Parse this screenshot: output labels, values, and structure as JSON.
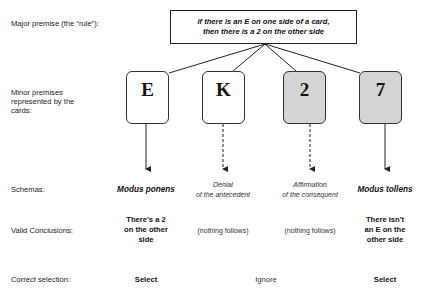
{
  "row_labels": {
    "major": "Major premise (the “rule”):",
    "minor_1": "Minor premises",
    "minor_2": "represented by the",
    "minor_3": "cards:",
    "schemas": "Schemas:",
    "conclusions": "Valid Conclusions:",
    "selection": "Correct selection:"
  },
  "rule": {
    "line1": "if there is an E on one side of a card,",
    "line2": "then there is a 2 on the other side"
  },
  "cards": [
    {
      "face": "E",
      "fill": "#ffffff",
      "arrow": "solid",
      "schema": [
        "Modus ponens"
      ],
      "schema_style": "bold-italic",
      "conclusion": [
        "There's a 2",
        "on the other",
        "side"
      ],
      "conclusion_style": "bold"
    },
    {
      "face": "K",
      "fill": "#ffffff",
      "arrow": "dashed",
      "schema": [
        "Denial",
        "of the antecedent"
      ],
      "schema_style": "italic",
      "conclusion": [
        "(nothing follows)"
      ],
      "conclusion_style": "plain"
    },
    {
      "face": "2",
      "fill": "#d4d4d4",
      "arrow": "dashed",
      "schema": [
        "Affirmation",
        "of the consequent"
      ],
      "schema_style": "italic",
      "conclusion": [
        "(nothing follows)"
      ],
      "conclusion_style": "plain"
    },
    {
      "face": "7",
      "fill": "#d4d4d4",
      "arrow": "solid",
      "schema": [
        "Modus tollens"
      ],
      "schema_style": "bold-italic",
      "conclusion": [
        "There isn't",
        "an E on the",
        "other side"
      ],
      "conclusion_style": "bold"
    }
  ],
  "selection": {
    "left": "Select",
    "middle": "Ignore",
    "right": "Select"
  },
  "colors": {
    "card_white": "#ffffff",
    "card_gray": "#d4d4d4",
    "line": "#222222"
  }
}
